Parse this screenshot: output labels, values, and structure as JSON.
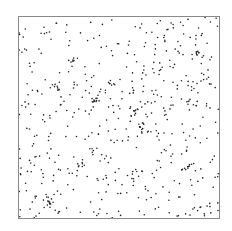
{
  "chart_data": {
    "type": "scatter",
    "title": "",
    "xlabel": "",
    "ylabel": "",
    "xlim": [
      0,
      1
    ],
    "ylim": [
      0,
      1
    ],
    "grid": false,
    "legend": null,
    "axes_ticks": false,
    "frame_color": "#8a8a8a",
    "point_color": "#222222",
    "point_radius": 0.8,
    "clusters": [
      {
        "x": 0.27,
        "y": 0.78,
        "n": 8
      },
      {
        "x": 0.38,
        "y": 0.58,
        "n": 12
      },
      {
        "x": 0.46,
        "y": 0.67,
        "n": 8
      },
      {
        "x": 0.58,
        "y": 0.53,
        "n": 10
      },
      {
        "x": 0.62,
        "y": 0.46,
        "n": 10
      },
      {
        "x": 0.18,
        "y": 0.65,
        "n": 8
      },
      {
        "x": 0.15,
        "y": 0.08,
        "n": 10
      },
      {
        "x": 0.84,
        "y": 0.26,
        "n": 8
      },
      {
        "x": 0.89,
        "y": 0.82,
        "n": 6
      },
      {
        "x": 0.56,
        "y": 0.21,
        "n": 6
      },
      {
        "x": 0.32,
        "y": 0.27,
        "n": 6
      },
      {
        "x": 0.85,
        "y": 0.57,
        "n": 5
      }
    ],
    "background_points": 480,
    "seed": 7
  }
}
